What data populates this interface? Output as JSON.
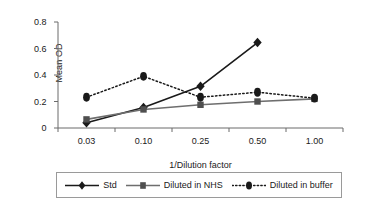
{
  "chart_data": {
    "type": "line",
    "title": "",
    "xlabel": "1/Dilution factor",
    "ylabel": "Mean OD",
    "categories": [
      "0.03",
      "0.10",
      "0.25",
      "0.50",
      "1.00"
    ],
    "ylim": [
      0,
      0.8
    ],
    "yticks": [
      "0",
      "0.2",
      "0.4",
      "0.6",
      "0.8"
    ],
    "ytick_values": [
      0,
      0.2,
      0.4,
      0.6,
      0.8
    ],
    "grid": false,
    "legend_position": "bottom",
    "series": [
      {
        "name": "Std",
        "marker": "diamond",
        "line_style": "solid",
        "color": "#1a1a1a",
        "values": [
          0.04,
          0.155,
          0.315,
          0.645,
          null
        ]
      },
      {
        "name": "Diluted in NHS",
        "marker": "square",
        "line_style": "solid",
        "color": "#6e6e6e",
        "values": [
          0.065,
          0.14,
          0.175,
          0.2,
          0.22
        ]
      },
      {
        "name": "Diluted in buffer",
        "marker": "circle",
        "line_style": "dotted",
        "color": "#1a1a1a",
        "values": [
          0.232,
          0.39,
          0.232,
          0.27,
          0.225
        ]
      }
    ]
  },
  "legend": {
    "entries": [
      {
        "label": "Std"
      },
      {
        "label": "Diluted in NHS"
      },
      {
        "label": "Diluted in buffer"
      }
    ]
  },
  "colors": {
    "axis": "#6b6b6b",
    "std": "#1a1a1a",
    "nhs": "#6e6e6e",
    "buffer": "#1a1a1a",
    "legend_border": "#9a9a9a",
    "background": "#ffffff"
  }
}
